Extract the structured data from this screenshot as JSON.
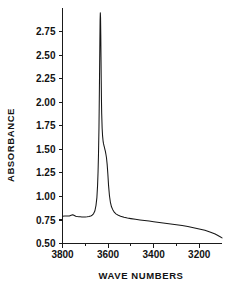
{
  "chart_data": {
    "type": "line",
    "title": "",
    "xlabel": "WAVE NUMBERS",
    "ylabel": "ABSORBANCE",
    "xlim": [
      3800,
      3100
    ],
    "ylim": [
      0.5,
      3.0
    ],
    "x_ticks": [
      3800,
      3600,
      3400,
      3200
    ],
    "x_tick_labels": [
      "3800",
      "3600",
      "3400",
      "3200"
    ],
    "x_minor_ticks": [
      3700,
      3500,
      3300
    ],
    "y_ticks": [
      0.5,
      0.75,
      1.0,
      1.25,
      1.5,
      1.75,
      2.0,
      2.25,
      2.5,
      2.75
    ],
    "y_tick_labels": [
      "0.50",
      "0.75",
      "1.00",
      "1.25",
      "1.50",
      "1.75",
      "2.00",
      "2.25",
      "2.50",
      "2.75"
    ],
    "grid": false,
    "legend": null,
    "axis_direction": "x-reversed",
    "series": [
      {
        "name": "absorbance",
        "color": "#161616",
        "x": [
          3800,
          3790,
          3780,
          3770,
          3762,
          3755,
          3748,
          3742,
          3735,
          3728,
          3722,
          3715,
          3708,
          3700,
          3692,
          3684,
          3676,
          3670,
          3664,
          3658,
          3653,
          3649,
          3646,
          3644,
          3642,
          3640,
          3639,
          3638,
          3637,
          3636,
          3635,
          3634,
          3633,
          3632,
          3631,
          3630,
          3629,
          3628,
          3626,
          3624,
          3622,
          3620,
          3618,
          3616,
          3614,
          3612,
          3610,
          3607,
          3604,
          3601,
          3598,
          3594,
          3590,
          3585,
          3580,
          3572,
          3564,
          3555,
          3545,
          3530,
          3515,
          3500,
          3480,
          3460,
          3440,
          3420,
          3400,
          3375,
          3350,
          3325,
          3300,
          3275,
          3250,
          3225,
          3200,
          3175,
          3150,
          3130,
          3110,
          3100
        ],
        "y": [
          0.79,
          0.791,
          0.792,
          0.793,
          0.8,
          0.806,
          0.797,
          0.789,
          0.786,
          0.784,
          0.783,
          0.782,
          0.782,
          0.782,
          0.783,
          0.786,
          0.792,
          0.8,
          0.815,
          0.845,
          0.905,
          0.99,
          1.12,
          1.26,
          1.45,
          1.72,
          1.93,
          2.15,
          2.4,
          2.65,
          2.87,
          2.95,
          2.9,
          2.72,
          2.48,
          2.23,
          2.02,
          1.88,
          1.72,
          1.64,
          1.59,
          1.56,
          1.54,
          1.52,
          1.5,
          1.48,
          1.455,
          1.41,
          1.34,
          1.24,
          1.12,
          1.01,
          0.94,
          0.89,
          0.862,
          0.83,
          0.812,
          0.8,
          0.79,
          0.778,
          0.77,
          0.764,
          0.757,
          0.75,
          0.744,
          0.738,
          0.732,
          0.724,
          0.716,
          0.708,
          0.7,
          0.69,
          0.68,
          0.668,
          0.655,
          0.64,
          0.62,
          0.6,
          0.575,
          0.56
        ]
      }
    ],
    "annotations": [
      {
        "text": "main-peak",
        "x": 3634,
        "y": 2.95
      },
      {
        "text": "shoulder",
        "x": 3610,
        "y": 1.46
      },
      {
        "text": "baseline-bump",
        "x": 3755,
        "y": 0.806
      }
    ]
  },
  "axes": {
    "y_axis_title": "ABSORBANCE",
    "x_axis_title": "WAVE NUMBERS"
  },
  "colors": {
    "background": "#ffffff",
    "foreground": "#161616",
    "axis": "#1a1a1a"
  }
}
